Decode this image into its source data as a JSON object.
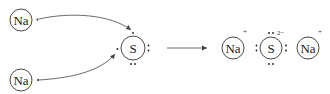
{
  "diagram": {
    "reactants": {
      "sodium_top": {
        "symbol": "Na",
        "valence_electrons": 1
      },
      "sodium_bottom": {
        "symbol": "Na",
        "valence_electrons": 1
      },
      "sulfur": {
        "symbol": "S",
        "valence_electrons": 6
      }
    },
    "reaction_arrow": "→",
    "product": {
      "sodium_left": {
        "symbol": "Na",
        "charge": "+"
      },
      "sulfide": {
        "symbol": "S",
        "charge": "2−",
        "valence_electrons": 8
      },
      "sodium_right": {
        "symbol": "Na",
        "charge": "+"
      }
    },
    "colors": {
      "stroke": "#333333",
      "text": "#1a1a1a",
      "background": "#ffffff"
    }
  }
}
